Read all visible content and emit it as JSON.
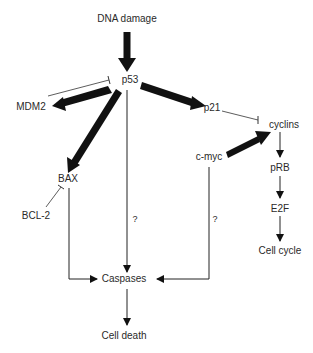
{
  "diagram": {
    "nodes": {
      "dna_damage": "DNA damage",
      "p53": "p53",
      "mdm2": "MDM2",
      "p21": "p21",
      "cyclins": "cyclins",
      "c_myc": "c-myc",
      "bax": "BAX",
      "bcl2": "BCL-2",
      "prb": "pRB",
      "e2f": "E2F",
      "cell_cycle": "Cell cycle",
      "caspases": "Caspases",
      "cell_death": "Cell death"
    },
    "unknown_labels": {
      "p53_to_caspases": "?",
      "cmyc_to_caspases": "?"
    },
    "edges": [
      {
        "from": "DNA damage",
        "to": "p53",
        "type": "activation-strong"
      },
      {
        "from": "p53",
        "to": "MDM2",
        "type": "activation-strong"
      },
      {
        "from": "MDM2",
        "to": "p53",
        "type": "inhibition"
      },
      {
        "from": "p53",
        "to": "p21",
        "type": "activation-strong"
      },
      {
        "from": "p53",
        "to": "BAX",
        "type": "activation-strong"
      },
      {
        "from": "p53",
        "to": "Caspases",
        "type": "activation",
        "label": "?"
      },
      {
        "from": "p21",
        "to": "cyclins",
        "type": "inhibition"
      },
      {
        "from": "c-myc",
        "to": "cyclins",
        "type": "activation-strong"
      },
      {
        "from": "c-myc",
        "to": "Caspases",
        "type": "activation",
        "label": "?"
      },
      {
        "from": "BCL-2",
        "to": "BAX",
        "type": "inhibition"
      },
      {
        "from": "BAX",
        "to": "Caspases",
        "type": "activation"
      },
      {
        "from": "cyclins",
        "to": "pRB",
        "type": "activation"
      },
      {
        "from": "pRB",
        "to": "E2F",
        "type": "activation"
      },
      {
        "from": "E2F",
        "to": "Cell cycle",
        "type": "activation"
      },
      {
        "from": "Caspases",
        "to": "Cell death",
        "type": "activation"
      }
    ]
  }
}
